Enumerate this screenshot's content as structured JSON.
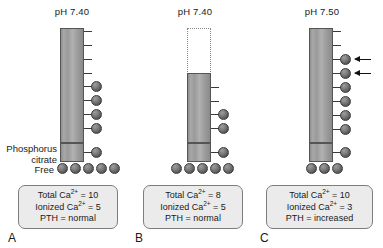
{
  "figure": {
    "free_label": "Free",
    "bound_label_line1": "Phosphorus",
    "bound_label_line2": "citrate"
  },
  "panels": [
    {
      "letter": "A",
      "ph": "pH 7.40",
      "bar": {
        "top": 28,
        "height": 115,
        "ghost": false
      },
      "ticks": [
        31,
        45,
        59,
        73
      ],
      "bound_spheres": [
        86,
        100,
        114,
        128
      ],
      "arrows": [],
      "pc_box": {
        "top": 143
      },
      "pc_sphere": true,
      "free_spheres": 5,
      "summary": {
        "total_label": "Total Ca",
        "total_value": "= 10",
        "ionized_label": "Ionized Ca",
        "ionized_value": "= 5",
        "pth_label": "PTH = normal",
        "charge": "2+"
      }
    },
    {
      "letter": "B",
      "ph": "pH 7.40",
      "bar": {
        "top": 73,
        "height": 70,
        "ghost": true
      },
      "ghost": {
        "top": 28,
        "height": 45
      },
      "ticks": [
        87,
        101
      ],
      "bound_spheres": [
        107,
        121
      ],
      "arrows": [],
      "pc_box": {
        "top": 143
      },
      "pc_sphere": true,
      "free_spheres": 5,
      "summary": {
        "total_label": "Total Ca",
        "total_value": "= 8",
        "ionized_label": "Ionized Ca",
        "ionized_value": "= 5",
        "pth_label": "PTH = normal",
        "charge": "2+"
      }
    },
    {
      "letter": "C",
      "ph": "pH 7.50",
      "bar": {
        "top": 28,
        "height": 115,
        "ghost": false
      },
      "ticks": [
        31,
        45
      ],
      "bound_spheres": [
        55,
        69,
        83,
        97,
        111,
        125
      ],
      "arrows": [
        55,
        69
      ],
      "pc_box": {
        "top": 143
      },
      "pc_sphere": true,
      "free_spheres": 3,
      "summary": {
        "total_label": "Total Ca",
        "total_value": "= 10",
        "ionized_label": "Ionized Ca",
        "ionized_value": "= 3",
        "pth_label": "PTH = increased",
        "charge": "2+"
      }
    }
  ],
  "colors": {
    "bar_fill": "#9d9d9d",
    "bar_border": "#555555",
    "sphere": "#5a5a5a",
    "summary_bg": "#ebebeb",
    "summary_border": "#7d7d7d",
    "text": "#1a1a1a"
  }
}
